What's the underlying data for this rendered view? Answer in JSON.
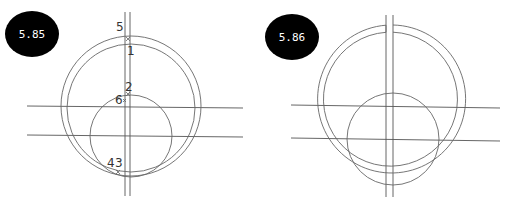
{
  "figures": [
    {
      "id": "5.85",
      "badge_label": "5.85",
      "point_labels": [
        {
          "text": "5"
        },
        {
          "text": "1"
        },
        {
          "text": "2"
        },
        {
          "text": "6"
        },
        {
          "text": "4"
        },
        {
          "text": "3"
        }
      ]
    },
    {
      "id": "5.86",
      "badge_label": "5.86"
    }
  ],
  "colors": {
    "badge_fill": "#000000",
    "badge_text": "#ffffff",
    "line": "#555555"
  }
}
